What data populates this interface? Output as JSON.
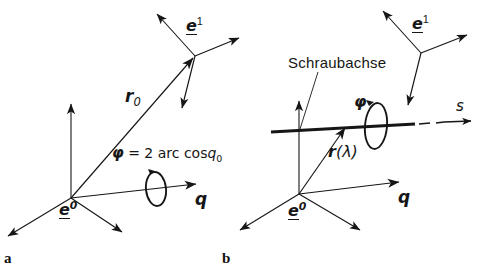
{
  "figure": {
    "background": "#ffffff",
    "ink": "#161616",
    "width": 479,
    "height": 270
  },
  "panels": [
    {
      "id": "a",
      "letter": "a",
      "labels": {
        "frame_initial": "e",
        "frame_initial_sup": "0",
        "frame_final": "e",
        "frame_final_sup": "1",
        "position_vector": "r",
        "position_vector_sub": "0",
        "rotation_axis": "q",
        "angle_formula_phi": "φ",
        "angle_formula_rest": " = 2 arc cos",
        "angle_formula_q": "q",
        "angle_formula_qsub": "0"
      }
    },
    {
      "id": "b",
      "letter": "b",
      "labels": {
        "screw_axis_caption": "Schraubachse",
        "frame_initial": "e",
        "frame_initial_sup": "0",
        "frame_final": "e",
        "frame_final_sup": "1",
        "position_vector": "r",
        "position_vector_arg": "(λ)",
        "rotation_axis": "q",
        "angle_symbol": "φ",
        "translation_axis": "s"
      }
    }
  ]
}
